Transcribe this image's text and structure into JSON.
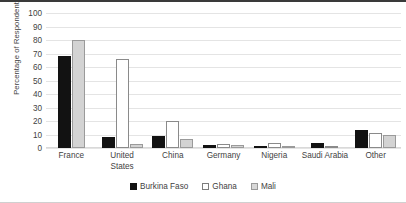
{
  "chart_data": {
    "type": "bar",
    "title": "",
    "xlabel": "",
    "ylabel": "Percentage of Respondents",
    "ylim": [
      0,
      100
    ],
    "yticks": [
      100,
      90,
      80,
      70,
      60,
      50,
      40,
      30,
      20,
      10,
      0
    ],
    "grid": true,
    "legend_position": "bottom",
    "categories": [
      "France",
      "United\nStates",
      "China",
      "Germany",
      "Nigeria",
      "Saudi Arabia",
      "Other"
    ],
    "series": [
      {
        "name": "Burkina Faso",
        "color": "#121212",
        "values": [
          68,
          8,
          9,
          2,
          1,
          4,
          13
        ]
      },
      {
        "name": "Ghana",
        "color": "#ffffff",
        "values": [
          0,
          66,
          20,
          3,
          4,
          1,
          11
        ]
      },
      {
        "name": "Mali",
        "color": "#d3d3d3",
        "values": [
          80,
          3,
          7,
          2,
          1,
          0,
          10
        ]
      }
    ]
  }
}
